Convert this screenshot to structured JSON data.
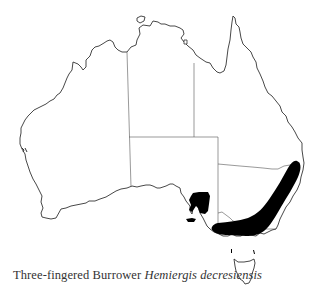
{
  "figure": {
    "type": "species distribution map",
    "region": "Australia",
    "caption": {
      "common_name": "Three-fingered Burrower",
      "scientific_name": "Hemiergis decresiensis"
    },
    "top_cutoff_text": "— — — — — — — — — — — — — —",
    "colors": {
      "coastline": "#333333",
      "state_borders": "#555555",
      "distribution_fill": "#000000",
      "background": "#ffffff"
    },
    "distribution_areas": [
      "south-eastern Australia: New South Wales slopes and Victoria",
      "south-east South Australia around Gulf St Vincent / Yorke Peninsula",
      "Kangaroo Island"
    ]
  }
}
